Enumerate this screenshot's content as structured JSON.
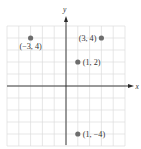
{
  "diagram": {
    "type": "coordinate-plane",
    "axes": {
      "x_label": "x",
      "y_label": "y"
    },
    "grid": {
      "x_range": [
        -5,
        5
      ],
      "y_range": [
        -5,
        5
      ],
      "step": 1
    },
    "points": [
      {
        "label": "(−3, 4)",
        "x": -3,
        "y": 4,
        "label_position": "below"
      },
      {
        "label": "(3, 4)",
        "x": 3,
        "y": 4,
        "label_position": "left"
      },
      {
        "label": "(1, 2)",
        "x": 1,
        "y": 2,
        "label_position": "right"
      },
      {
        "label": "(1, −4)",
        "x": 1,
        "y": -4,
        "label_position": "right"
      }
    ],
    "colors": {
      "grid": "#dcdcdc",
      "axis": "#2a2a2a",
      "point": "#6d6d6d",
      "text": "#333333"
    }
  }
}
